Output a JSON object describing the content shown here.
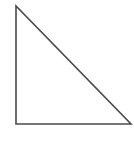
{
  "diagram": {
    "shape": "right-triangle",
    "vertices": [
      {
        "name": "top",
        "x": 16,
        "y": 6
      },
      {
        "name": "bottom-left",
        "x": 16,
        "y": 124
      },
      {
        "name": "bottom-right",
        "x": 131,
        "y": 124
      }
    ],
    "stroke_color": "#4a4a4a",
    "fill_color": "#ffffff",
    "stroke_width": 1.6
  }
}
